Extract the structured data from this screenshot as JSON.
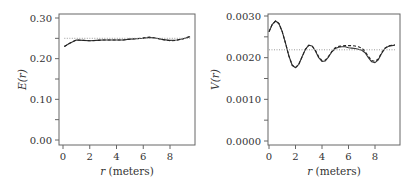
{
  "chart_data": [
    {
      "type": "line",
      "title": "",
      "xlabel": "r (meters)",
      "ylabel": "E(r)",
      "xlim": [
        -0.4,
        9.9
      ],
      "ylim": [
        -0.01,
        0.31
      ],
      "xticks": [
        "0",
        "2",
        "4",
        "6",
        "8"
      ],
      "yticks": [
        "0.00",
        "0.10",
        "0.20",
        "0.30"
      ],
      "grid": false,
      "legend": null,
      "x": [
        0.1,
        0.5,
        1.0,
        1.5,
        2.0,
        2.5,
        3.0,
        3.5,
        4.0,
        4.5,
        5.0,
        5.5,
        6.0,
        6.5,
        7.0,
        7.5,
        8.0,
        8.5,
        9.0,
        9.5
      ],
      "series": [
        {
          "name": "solid",
          "style": "solid",
          "values": [
            0.23,
            0.238,
            0.246,
            0.245,
            0.244,
            0.245,
            0.246,
            0.246,
            0.246,
            0.246,
            0.248,
            0.249,
            0.25,
            0.252,
            0.25,
            0.247,
            0.245,
            0.246,
            0.249,
            0.254
          ]
        },
        {
          "name": "dashed",
          "style": "dashed",
          "values": [
            0.23,
            0.238,
            0.246,
            0.245,
            0.244,
            0.245,
            0.246,
            0.246,
            0.246,
            0.246,
            0.248,
            0.249,
            0.251,
            0.253,
            0.25,
            0.247,
            0.244,
            0.245,
            0.249,
            0.255
          ]
        },
        {
          "name": "reference",
          "style": "dotted",
          "values": [
            0.25,
            0.25,
            0.25,
            0.25,
            0.25,
            0.25,
            0.25,
            0.25,
            0.25,
            0.25,
            0.25,
            0.25,
            0.25,
            0.25,
            0.25,
            0.25,
            0.25,
            0.25,
            0.25,
            0.25
          ]
        }
      ]
    },
    {
      "type": "line",
      "title": "",
      "xlabel": "r (meters)",
      "ylabel": "V(r)",
      "xlim": [
        -0.4,
        9.9
      ],
      "ylim": [
        -0.0001,
        0.0031
      ],
      "xticks": [
        "0",
        "2",
        "4",
        "6",
        "8"
      ],
      "yticks": [
        "0.0000",
        "0.0010",
        "0.0020",
        "0.0030"
      ],
      "grid": false,
      "legend": null,
      "x": [
        0.0,
        0.25,
        0.5,
        0.75,
        1.0,
        1.25,
        1.5,
        1.75,
        2.0,
        2.25,
        2.5,
        2.75,
        3.0,
        3.25,
        3.5,
        3.75,
        4.0,
        4.25,
        4.5,
        4.75,
        5.0,
        5.25,
        5.5,
        5.75,
        6.0,
        6.25,
        6.5,
        6.75,
        7.0,
        7.25,
        7.5,
        7.75,
        8.0,
        8.25,
        8.5,
        8.75,
        9.0,
        9.25,
        9.5
      ],
      "series": [
        {
          "name": "solid",
          "style": "solid",
          "values": [
            0.00262,
            0.0028,
            0.00288,
            0.00282,
            0.00262,
            0.00234,
            0.00204,
            0.00182,
            0.00176,
            0.00184,
            0.00202,
            0.0022,
            0.0023,
            0.00228,
            0.00216,
            0.002,
            0.00191,
            0.00192,
            0.00202,
            0.00214,
            0.00222,
            0.00225,
            0.00226,
            0.00226,
            0.00224,
            0.00223,
            0.00222,
            0.0022,
            0.00218,
            0.00212,
            0.002,
            0.0019,
            0.00188,
            0.00195,
            0.0021,
            0.00222,
            0.00227,
            0.00229,
            0.0023
          ]
        },
        {
          "name": "dashed",
          "style": "dashed",
          "values": [
            0.00262,
            0.0028,
            0.00288,
            0.00282,
            0.00262,
            0.00234,
            0.00204,
            0.00182,
            0.00176,
            0.00184,
            0.00202,
            0.0022,
            0.0023,
            0.00228,
            0.00218,
            0.00202,
            0.00193,
            0.00194,
            0.00203,
            0.00215,
            0.00224,
            0.00227,
            0.00228,
            0.00229,
            0.00229,
            0.00229,
            0.00228,
            0.00226,
            0.00223,
            0.00215,
            0.00203,
            0.00193,
            0.00191,
            0.00197,
            0.00212,
            0.00223,
            0.00228,
            0.0023,
            0.00231
          ]
        },
        {
          "name": "reference",
          "style": "dotted",
          "values": [
            0.00219,
            0.00219,
            0.00219,
            0.00219,
            0.00219,
            0.00219,
            0.00219,
            0.00219,
            0.00219,
            0.00219,
            0.00219,
            0.00219,
            0.00219,
            0.00219,
            0.00219,
            0.00219,
            0.00219,
            0.00219,
            0.00219,
            0.00219,
            0.00219,
            0.00219,
            0.00219,
            0.00219,
            0.00219,
            0.00219,
            0.00219,
            0.00219,
            0.00219,
            0.00219,
            0.00219,
            0.00219,
            0.00219,
            0.00219,
            0.00219,
            0.00219,
            0.00219,
            0.00219,
            0.00219
          ]
        }
      ]
    }
  ],
  "panels": [
    {
      "frame": {
        "x0": 59,
        "x1": 195,
        "y0": 14,
        "y1": 145
      },
      "xpix": [
        63,
        170
      ],
      "xval": [
        0,
        8
      ],
      "ypix": [
        140,
        18
      ],
      "yval": [
        0.0,
        0.3
      ],
      "ytick_vals": [
        0.0,
        0.05,
        0.1,
        0.15,
        0.2,
        0.25,
        0.3
      ],
      "ylabel_x": 20
    },
    {
      "frame": {
        "x0": 268,
        "x1": 400,
        "y0": 14,
        "y1": 145
      },
      "xpix": [
        269,
        375
      ],
      "xval": [
        0,
        8
      ],
      "ypix": [
        141,
        16
      ],
      "yval": [
        0.0,
        0.003
      ],
      "ytick_vals": [
        0.0,
        0.0005,
        0.001,
        0.0015,
        0.002,
        0.0025,
        0.003
      ],
      "ylabel_x": 213
    }
  ]
}
